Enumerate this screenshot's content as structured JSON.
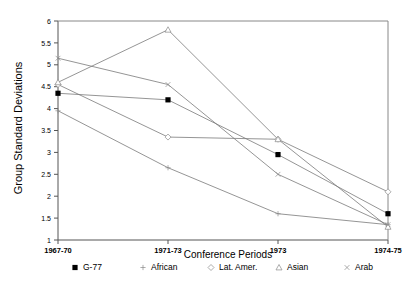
{
  "chart_data": {
    "type": "line",
    "title": "",
    "xlabel": "Conference Periods",
    "ylabel": "Group Standard Deviations",
    "categories": [
      "1967-70",
      "1971-73",
      "1973",
      "1974-75"
    ],
    "ylim": [
      1,
      6
    ],
    "yticks": [
      1,
      1.5,
      2,
      2.5,
      3,
      3.5,
      4,
      4.5,
      5,
      5.5,
      6
    ],
    "ytick_labels": [
      "1",
      "1.5",
      "2",
      "2.5",
      "3",
      "3.5",
      "4",
      "4.5",
      "5",
      "5.5",
      "6"
    ],
    "grid": false,
    "legend_position": "bottom",
    "series": [
      {
        "name": "G-77",
        "marker": "filled-square",
        "values": [
          4.35,
          4.2,
          2.95,
          1.6
        ]
      },
      {
        "name": "African",
        "marker": "plus",
        "values": [
          3.95,
          2.65,
          1.6,
          1.35
        ]
      },
      {
        "name": "Lat. Amer.",
        "marker": "diamond",
        "values": [
          4.55,
          3.35,
          3.3,
          2.1
        ]
      },
      {
        "name": "Asian",
        "marker": "triangle",
        "values": [
          4.6,
          5.8,
          3.3,
          1.3
        ]
      },
      {
        "name": "Arab",
        "marker": "cross",
        "values": [
          5.15,
          4.55,
          2.5,
          1.35
        ]
      }
    ]
  },
  "axes": {
    "y_title": "Group Standard Deviations",
    "x_title": "Conference Periods"
  },
  "legend": {
    "items": [
      {
        "label": "G-77",
        "marker": "filled-square"
      },
      {
        "label": "African",
        "marker": "plus"
      },
      {
        "label": "Lat. Amer.",
        "marker": "diamond"
      },
      {
        "label": "Asian",
        "marker": "triangle"
      },
      {
        "label": "Arab",
        "marker": "cross"
      }
    ]
  },
  "colors": {
    "line": "#7a7a7a",
    "marker_stroke": "#8a8a8a",
    "axis": "#555555",
    "frame": "#888888",
    "text": "#000000",
    "background": "#ffffff"
  }
}
